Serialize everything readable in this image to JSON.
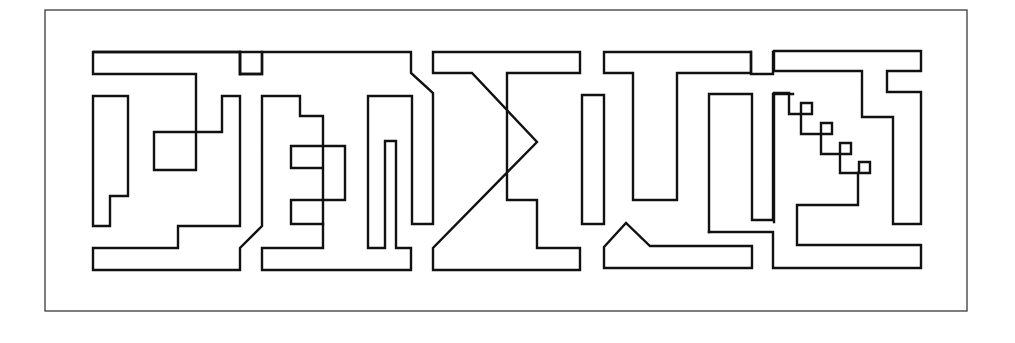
{
  "diagram": {
    "colors": {
      "background": "#ffffff",
      "line": "#111111",
      "frame": "#3a3a3a"
    },
    "frame": {
      "x": 45,
      "y": 10,
      "width": 922,
      "height": 301
    },
    "shapes": [
      {
        "name": "glyph1-top-bar",
        "type": "polygon",
        "points": "93,52 240,52 240,74 262,74 262,52 262,52"
      },
      {
        "name": "glyph1-top-bar-outline",
        "type": "polyline",
        "points": "240,74 240,52 93,52 93,74 196,74 196,170 154,170 154,132 222,132 222,96 240,96 240,226 178,226 178,248 93,248 93,270 240,270 240,248 262,226 262,96 300,96 300,116 323,116 323,224 291,224 291,200 345,200 345,146 291,146 291,168 323,168"
      },
      {
        "name": "glyph1-left-column",
        "type": "polygon",
        "points": "93,96 128,96 128,196 110,196 110,226 93,226"
      },
      {
        "name": "glyph1-notch",
        "type": "polyline",
        "points": "240,52 240,74 262,74 262,52 411,52 411,73 433,93 433,224 412,224 412,96 368,96 368,248 385,248 385,141 396,141 396,248 411,248 411,270 262,270 262,248 323,248 323,224"
      },
      {
        "name": "glyph3-sigma",
        "type": "polyline",
        "points": "433,52 580,52 580,73 507,73 507,200 537,200 537,248 580,248 580,270 433,270 433,248 537,142 472,73 433,73 433,52"
      },
      {
        "name": "glyph3-right-column",
        "type": "polygon",
        "points": "582,95 604,95 604,224 582,224"
      },
      {
        "name": "glyph4-top",
        "type": "polyline",
        "points": "604,52 751,52 751,73 677,73 677,200 633,200 633,73 604,73 604,52"
      },
      {
        "name": "glyph4-bottom",
        "type": "polygon",
        "points": "604,247 626,223 650,246 752,246 752,268 604,268"
      },
      {
        "name": "glyph4-u",
        "type": "polyline",
        "points": "773,52 773,74 751,74 751,52"
      },
      {
        "name": "glyph4-inner-u",
        "type": "polyline",
        "points": "709,232 709,94 752,94 752,220 773,220 773,94 793,94"
      },
      {
        "name": "glyph5-lower-path",
        "type": "polyline",
        "points": "709,232 773,232 773,268 921,268 921,245 797,245 797,205 858,205 858,173"
      },
      {
        "name": "glyph5-stair",
        "type": "polyline",
        "points": "774,222 774,93 789,93 789,114 812,114 812,103 801,103 801,134 832,134 832,123 821,123 821,154 851,154 851,143 840,143 840,173 870,173 870,162 859,162 859,173"
      },
      {
        "name": "glyph5-top",
        "type": "polyline",
        "points": "774,71 774,51 921,51 921,71 887,71 887,92 921,92 921,224 893,224 893,117 862,117 862,71 774,71"
      }
    ]
  }
}
